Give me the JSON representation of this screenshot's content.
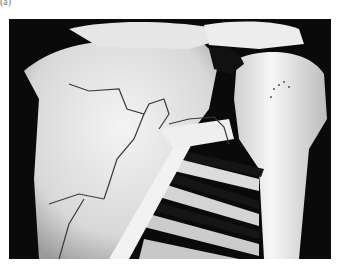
{
  "figure": {
    "panel_label": "(a)",
    "colors": {
      "background": "#0a0a0a",
      "bone": "#e8e8e8",
      "shadow": "#8a8a8a",
      "fracture_line": "#3a3a3a"
    }
  }
}
